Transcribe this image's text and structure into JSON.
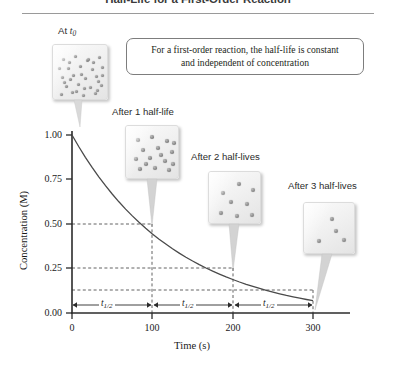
{
  "title": "Half-Life for a First-Order Reaction",
  "callout": {
    "line1": "For a first-order reaction, the half-life is constant",
    "line2": "and independent of concentration"
  },
  "panels": [
    {
      "label_prefix": "At ",
      "label_italic": "t",
      "label_sub": "0",
      "label_suffix": "",
      "dots": 32,
      "concentration": 1.0,
      "time": 0
    },
    {
      "label_prefix": "After 1 half-life",
      "label_italic": "",
      "label_sub": "",
      "label_suffix": "",
      "dots": 16,
      "concentration": 0.5,
      "time": 100
    },
    {
      "label_prefix": "After 2 half-lives",
      "label_italic": "",
      "label_sub": "",
      "label_suffix": "",
      "dots": 8,
      "concentration": 0.25,
      "time": 200
    },
    {
      "label_prefix": "After 3 half-lives",
      "label_italic": "",
      "label_sub": "",
      "label_suffix": "",
      "dots": 4,
      "concentration": 0.125,
      "time": 300
    }
  ],
  "halflife_spans": [
    {
      "label": "t",
      "sub": "1/2",
      "from": 0,
      "to": 100
    },
    {
      "label": "t",
      "sub": "1/2",
      "from": 100,
      "to": 200
    },
    {
      "label": "t",
      "sub": "1/2",
      "from": 200,
      "to": 300
    }
  ],
  "chart_data": {
    "type": "line",
    "title": "Half-Life for a First-Order Reaction",
    "xlabel": "Time (s)",
    "ylabel": "Concentration (M)",
    "xlim": [
      0,
      300
    ],
    "ylim": [
      0,
      1.0
    ],
    "xticks": [
      0,
      100,
      200,
      300
    ],
    "xticklabels": [
      "0",
      "100",
      "200",
      "300"
    ],
    "yticks": [
      0.0,
      0.25,
      0.5,
      0.75,
      1.0
    ],
    "yticklabels": [
      "0.00",
      "0.25",
      "0.50",
      "0.75",
      "1.00"
    ],
    "grid": false,
    "legend": false,
    "half_life": 100,
    "initial_concentration": 1.0,
    "series": [
      {
        "name": "Concentration vs time",
        "x": [
          0,
          25,
          50,
          75,
          100,
          125,
          150,
          175,
          200,
          225,
          250,
          275,
          300
        ],
        "y": [
          1.0,
          0.841,
          0.707,
          0.595,
          0.5,
          0.42,
          0.354,
          0.297,
          0.25,
          0.21,
          0.177,
          0.149,
          0.125
        ]
      }
    ],
    "markers": [
      {
        "x": 0,
        "y": 1.0,
        "label": "1.00"
      },
      {
        "x": 100,
        "y": 0.5,
        "label": "0.50"
      },
      {
        "x": 200,
        "y": 0.25,
        "label": "0.25"
      },
      {
        "x": 300,
        "y": 0.125,
        "label": "0.125"
      }
    ],
    "annotations": [
      "At t0",
      "After 1 half-life",
      "After 2 half-lives",
      "After 3 half-lives",
      "For a first-order reaction, the half-life is constant and independent of concentration"
    ]
  },
  "colors": {
    "curve": "#4a4a4a",
    "axis": "#2b2b2b",
    "dashed": "#3a3a3a",
    "title": "#3b3b3b",
    "rule": "#9a9a9a"
  }
}
